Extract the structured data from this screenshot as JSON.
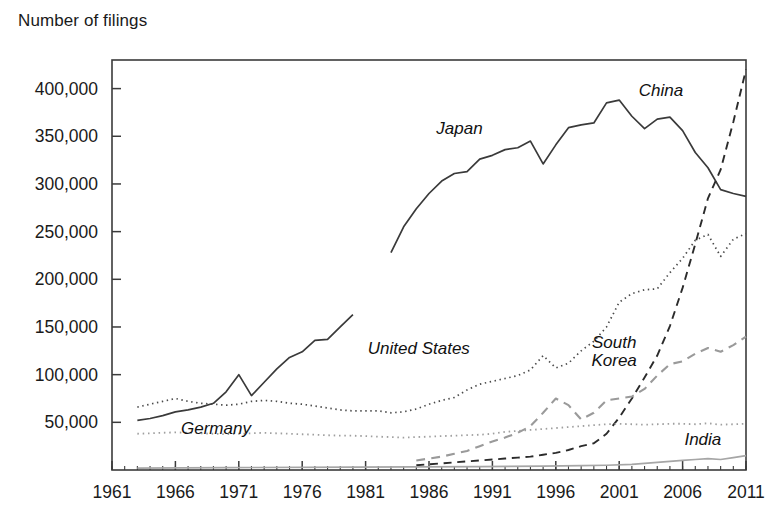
{
  "chart_data": {
    "type": "line",
    "title": "",
    "ylabel": "Number of filings",
    "xlabel": "",
    "xlim": [
      1961,
      2011
    ],
    "ylim": [
      0,
      430000
    ],
    "grid": false,
    "legend_position": "inline-annotations",
    "y_ticks": [
      50000,
      100000,
      150000,
      200000,
      250000,
      300000,
      350000,
      400000
    ],
    "y_tick_labels": [
      "50,000",
      "100,000",
      "150,000",
      "200,000",
      "250,000",
      "300,000",
      "350,000",
      "400,000"
    ],
    "x_ticks": [
      1961,
      1966,
      1971,
      1976,
      1981,
      1986,
      1991,
      1996,
      2001,
      2006,
      2011
    ],
    "x_tick_labels": [
      "1961",
      "1966",
      "1971",
      "1976",
      "1981",
      "1986",
      "1991",
      "1996",
      "2001",
      "2006",
      "2011"
    ],
    "x_minor_step": 1,
    "series": [
      {
        "name": "Japan",
        "style": "solid",
        "color": "#3a3a3a",
        "width": 1.7,
        "label_x": 1988.4,
        "label_y": 352000,
        "segments": [
          {
            "x": [
              1963,
              1964,
              1965,
              1966,
              1967,
              1968,
              1969,
              1970,
              1971,
              1972,
              1973,
              1974,
              1975,
              1976,
              1977,
              1978,
              1979,
              1980
            ],
            "values": [
              52000,
              54000,
              57000,
              61000,
              63000,
              66000,
              70000,
              82000,
              100000,
              78000,
              92000,
              106000,
              118000,
              124000,
              136000,
              137000,
              150000,
              163000
            ]
          },
          {
            "x": [
              1983,
              1984,
              1985,
              1986,
              1987,
              1988,
              1989,
              1990,
              1991,
              1992,
              1993,
              1994,
              1995,
              1996,
              1997,
              1998,
              1999,
              2000,
              2001,
              2002,
              2003,
              2004,
              2005,
              2006,
              2007,
              2008,
              2009,
              2010,
              2011
            ],
            "values": [
              228000,
              255000,
              274000,
              290000,
              303000,
              311000,
              313000,
              326000,
              330000,
              336000,
              338000,
              345000,
              321000,
              341000,
              359000,
              362000,
              364000,
              385000,
              388000,
              371000,
              358000,
              368000,
              370000,
              356000,
              333000,
              317000,
              294000,
              290000,
              287000
            ]
          }
        ]
      },
      {
        "name": "United States",
        "style": "dotted",
        "color": "#4a4a4a",
        "width": 1.7,
        "label_x": 1985.2,
        "label_y": 122000,
        "segments": [
          {
            "x": [
              1963,
              1964,
              1965,
              1966,
              1967,
              1968,
              1969,
              1970,
              1971,
              1972,
              1973,
              1974,
              1975,
              1976,
              1977,
              1978,
              1979,
              1980,
              1981,
              1982,
              1983,
              1984,
              1985,
              1986,
              1987,
              1988,
              1989,
              1990,
              1991,
              1992,
              1993,
              1994,
              1995,
              1996,
              1997,
              1998,
              1999,
              2000,
              2001,
              2002,
              2003,
              2004,
              2005,
              2006,
              2007,
              2008,
              2009,
              2010,
              2011
            ],
            "values": [
              66000,
              69000,
              72000,
              75000,
              72000,
              70000,
              69000,
              68000,
              69000,
              72000,
              73000,
              72000,
              70000,
              69000,
              67000,
              65000,
              63000,
              62000,
              62000,
              62000,
              60000,
              61000,
              64000,
              69000,
              73000,
              76000,
              84000,
              90000,
              93000,
              96000,
              99000,
              105000,
              120000,
              107000,
              112000,
              125000,
              135000,
              150000,
              176000,
              185000,
              189000,
              190000,
              207000,
              222000,
              241000,
              247000,
              224000,
              242000,
              248000
            ]
          }
        ]
      },
      {
        "name": "China",
        "style": "dashed",
        "color": "#2b2b2b",
        "width": 1.9,
        "label_x": 2004.3,
        "label_y": 392000,
        "segments": [
          {
            "x": [
              1985,
              1986,
              1987,
              1988,
              1989,
              1990,
              1991,
              1992,
              1993,
              1994,
              1995,
              1996,
              1997,
              1998,
              1999,
              2000,
              2001,
              2002,
              2003,
              2004,
              2005,
              2006,
              2007,
              2008,
              2009,
              2010,
              2011
            ],
            "values": [
              5000,
              6000,
              7000,
              8000,
              9000,
              10000,
              11000,
              12000,
              13000,
              14000,
              16000,
              18000,
              21000,
              25000,
              28000,
              38000,
              55000,
              75000,
              97000,
              120000,
              151000,
              191000,
              237000,
              285000,
              315000,
              365000,
              420000
            ]
          }
        ]
      },
      {
        "name": "South Korea",
        "style": "dashed",
        "color": "#9a9a9a",
        "width": 2.1,
        "label_x": 2000.6,
        "label_y": 128000,
        "label_lines": [
          "South",
          "Korea"
        ],
        "segments": [
          {
            "x": [
              1985,
              1986,
              1987,
              1988,
              1989,
              1990,
              1991,
              1992,
              1993,
              1994,
              1995,
              1996,
              1997,
              1998,
              1999,
              2000,
              2001,
              2002,
              2003,
              2004,
              2005,
              2006,
              2007,
              2008,
              2009,
              2010,
              2011
            ],
            "values": [
              10000,
              12000,
              14000,
              17000,
              20000,
              25000,
              30000,
              34000,
              39000,
              46000,
              60000,
              75000,
              68000,
              53000,
              60000,
              73000,
              75000,
              77000,
              85000,
              99000,
              111000,
              114000,
              122000,
              128000,
              124000,
              131000,
              140000
            ]
          }
        ]
      },
      {
        "name": "Germany",
        "style": "dotted",
        "color": "#9f9f9f",
        "width": 1.8,
        "label_x": 1969.2,
        "label_y": 38000,
        "segments": [
          {
            "x": [
              1963,
              1964,
              1965,
              1966,
              1967,
              1968,
              1969,
              1970,
              1971,
              1972,
              1973,
              1974,
              1975,
              1976,
              1977,
              1978,
              1979,
              1980,
              1981,
              1982,
              1983,
              1984,
              1985,
              1986,
              1987,
              1988,
              1989,
              1990,
              1991,
              1992,
              1993,
              1994,
              1995,
              1996,
              1997,
              1998,
              1999,
              2000,
              2001,
              2002,
              2003,
              2004,
              2005,
              2006,
              2007,
              2008,
              2009,
              2010,
              2011
            ],
            "values": [
              38000,
              38500,
              39000,
              39500,
              39000,
              38500,
              38000,
              37500,
              38000,
              38500,
              39000,
              38500,
              38000,
              37500,
              37000,
              36500,
              36000,
              36000,
              35500,
              35000,
              34500,
              34000,
              34500,
              35000,
              35500,
              36000,
              36500,
              37000,
              38000,
              40000,
              41000,
              42000,
              43000,
              44000,
              45000,
              46000,
              47000,
              48000,
              48500,
              48000,
              47500,
              48000,
              48500,
              48500,
              48000,
              49000,
              47500,
              48000,
              48500
            ]
          }
        ]
      },
      {
        "name": "India",
        "style": "solid",
        "color": "#a6a6a6",
        "width": 1.7,
        "label_x": 2007.6,
        "label_y": 26000,
        "segments": [
          {
            "x": [
              1963,
              1970,
              1980,
              1990,
              1995,
              1998,
              2000,
              2002,
              2004,
              2005,
              2006,
              2007,
              2008,
              2009,
              2010,
              2011
            ],
            "values": [
              2000,
              2500,
              3000,
              3500,
              4000,
              4500,
              5000,
              6000,
              8000,
              9000,
              10000,
              11000,
              12000,
              11000,
              13000,
              15000
            ]
          }
        ]
      }
    ]
  }
}
